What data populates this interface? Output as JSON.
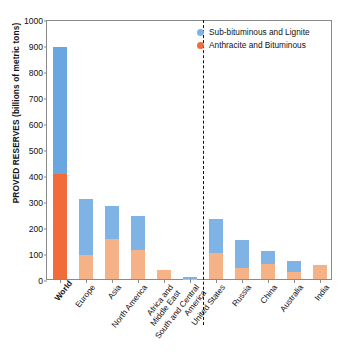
{
  "chart_data": {
    "type": "bar",
    "stacked": true,
    "title": "",
    "xlabel": "",
    "ylabel": "PROVED RESERVES (billions of metric tons)",
    "ylim": [
      0,
      1000
    ],
    "yticks": [
      0,
      100,
      200,
      300,
      400,
      500,
      600,
      700,
      800,
      900,
      1000
    ],
    "grid": false,
    "legend_position": "top-right",
    "categories": [
      "World",
      "Europe",
      "Asia",
      "North America",
      "Africa and Middle East",
      "South and Central America",
      "United States",
      "Russia",
      "China",
      "Australia",
      "India"
    ],
    "category_lines": [
      [
        "World"
      ],
      [
        "Europe"
      ],
      [
        "Asia"
      ],
      [
        "North America"
      ],
      [
        "Africa and",
        "Middle East"
      ],
      [
        "South and Central",
        "America"
      ],
      [
        "United States"
      ],
      [
        "Russia"
      ],
      [
        "China"
      ],
      [
        "Australia"
      ],
      [
        "India"
      ]
    ],
    "series": [
      {
        "name": "Anthracite and Bituminous",
        "color": "#F5B287",
        "highlight_color": "#F26B3A",
        "values": [
          404,
          92,
          153,
          110,
          33,
          1,
          101,
          42,
          59,
          27,
          53
        ]
      },
      {
        "name": "Sub-bituminous and Lignite",
        "color": "#7FB2E5",
        "highlight_color": "#6AA6E0",
        "values": [
          487,
          217,
          129,
          131,
          0,
          7,
          131,
          108,
          48,
          41,
          0
        ]
      }
    ],
    "totals": [
      891,
      309,
      282,
      241,
      33,
      8,
      232,
      150,
      107,
      68,
      53
    ],
    "highlight_category": "World",
    "divider_after": "South and Central America",
    "annotations": []
  },
  "legend": {
    "items": [
      {
        "label": "Sub-bituminous and Lignite",
        "color": "#7FB2E5"
      },
      {
        "label": "Anthracite and Bituminous",
        "color": "#F26B3A"
      }
    ]
  }
}
